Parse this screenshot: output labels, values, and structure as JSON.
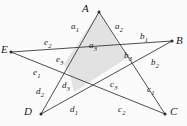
{
  "figure": {
    "background_color": "#fbfbfb",
    "line_color": "#3a3a3a",
    "shade_color": "#e2e2e2",
    "label_color": "#1a1a1a"
  },
  "vertices": [
    {
      "id": "A",
      "label": "A",
      "x": 99,
      "y": 12,
      "label_x": 82,
      "label_y": 3
    },
    {
      "id": "B",
      "label": "B",
      "x": 172,
      "y": 41,
      "label_x": 176,
      "label_y": 35
    },
    {
      "id": "C",
      "label": "C",
      "x": 165,
      "y": 114,
      "label_x": 170,
      "label_y": 106
    },
    {
      "id": "D",
      "label": "D",
      "x": 41,
      "y": 114,
      "label_x": 24,
      "label_y": 106
    },
    {
      "id": "E",
      "label": "E",
      "x": 11,
      "y": 52,
      "label_x": 1,
      "label_y": 44
    }
  ],
  "segments": [
    {
      "name": "a1",
      "base": "a",
      "sub": "1",
      "x": 71,
      "y": 22
    },
    {
      "name": "a2",
      "base": "a",
      "sub": "2",
      "x": 115,
      "y": 22
    },
    {
      "name": "a3",
      "base": "a",
      "sub": "3",
      "x": 89,
      "y": 41
    },
    {
      "name": "b1",
      "base": "b",
      "sub": "1",
      "x": 140,
      "y": 32
    },
    {
      "name": "b2",
      "base": "b",
      "sub": "2",
      "x": 151,
      "y": 58
    },
    {
      "name": "b3",
      "base": "b",
      "sub": "3",
      "x": 124,
      "y": 51
    },
    {
      "name": "c1",
      "base": "c",
      "sub": "1",
      "x": 147,
      "y": 85
    },
    {
      "name": "c2",
      "base": "c",
      "sub": "2",
      "x": 118,
      "y": 105
    },
    {
      "name": "c3",
      "base": "c",
      "sub": "3",
      "x": 110,
      "y": 80
    },
    {
      "name": "d1",
      "base": "d",
      "sub": "1",
      "x": 70,
      "y": 105
    },
    {
      "name": "d2",
      "base": "d",
      "sub": "2",
      "x": 36,
      "y": 87
    },
    {
      "name": "d3",
      "base": "d",
      "sub": "3",
      "x": 62,
      "y": 81
    },
    {
      "name": "e1",
      "base": "e",
      "sub": "1",
      "x": 33,
      "y": 68
    },
    {
      "name": "e2",
      "base": "e",
      "sub": "2",
      "x": 44,
      "y": 38
    },
    {
      "name": "e3",
      "base": "e",
      "sub": "3",
      "x": 56,
      "y": 55
    }
  ],
  "chords": [
    {
      "name": "chord-A-C",
      "from": "A",
      "to": "C"
    },
    {
      "name": "chord-A-D",
      "from": "A",
      "to": "D"
    },
    {
      "name": "chord-B-D",
      "from": "B",
      "to": "D"
    },
    {
      "name": "chord-B-E",
      "from": "B",
      "to": "E"
    },
    {
      "name": "chord-C-E",
      "from": "C",
      "to": "E"
    }
  ],
  "shaded_region": {
    "name": "shaded-triangle-region",
    "points": "99,12 127,58 74,92 71,78 64,64"
  }
}
